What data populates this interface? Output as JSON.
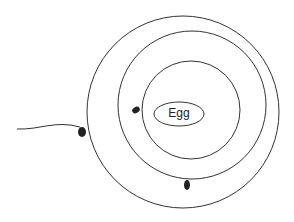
{
  "diagram": {
    "center_label": "Egg",
    "rings": 3,
    "sperm_count": 3,
    "stroke_color": "#333333",
    "background": "#ffffff"
  }
}
